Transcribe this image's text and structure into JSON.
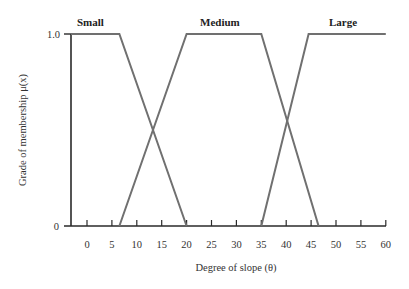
{
  "chart_data": {
    "type": "line",
    "title": "",
    "xlabel": "Degree of slope (θ)",
    "ylabel": "Grade of membership μ(x)",
    "xlim": [
      -3,
      60
    ],
    "ylim": [
      0,
      1.0
    ],
    "x_ticks": [
      0,
      5,
      10,
      15,
      20,
      25,
      30,
      35,
      40,
      45,
      50,
      55,
      60
    ],
    "y_ticks": [
      {
        "value": 0,
        "label": "0"
      },
      {
        "value": 1.0,
        "label": "1.0"
      }
    ],
    "grid": false,
    "legend": "inline labels above each set",
    "series": [
      {
        "name": "Small",
        "points": [
          [
            -3,
            1.0
          ],
          [
            6.5,
            1.0
          ],
          [
            20,
            0
          ]
        ]
      },
      {
        "name": "Medium",
        "points": [
          [
            6.5,
            0
          ],
          [
            20,
            1.0
          ],
          [
            35,
            1.0
          ],
          [
            46.5,
            0
          ]
        ]
      },
      {
        "name": "Large",
        "points": [
          [
            35,
            0
          ],
          [
            44.5,
            1.0
          ],
          [
            60,
            1.0
          ]
        ]
      }
    ]
  },
  "labels": {
    "small": "Small",
    "medium": "Medium",
    "large": "Large",
    "y_top": "1.0",
    "y_bottom": "0",
    "xlabel": "Degree of slope (θ)",
    "ylabel": "Grade of membership μ(x)"
  },
  "colors": {
    "axis": "#2a2a2a",
    "membership_line": "#707070"
  }
}
